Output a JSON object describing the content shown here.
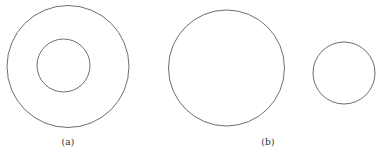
{
  "figure": {
    "background_color": "#ffffff",
    "stroke_color": "#4a4a4a",
    "stroke_width": 0.8,
    "width": 378,
    "height": 159,
    "panels": [
      {
        "id": "panel-a",
        "label": "(a)",
        "label_x": 68,
        "label_y": 142,
        "description": "annulus: one large circle with a concentric smaller circle inside",
        "shapes": [
          {
            "name": "outer-circle-a",
            "type": "circle",
            "cx": 68,
            "cy": 66.5,
            "r": 61
          },
          {
            "name": "inner-circle-a",
            "type": "circle",
            "cx": 63.5,
            "cy": 65.5,
            "r": 26.5
          }
        ]
      },
      {
        "id": "panel-b",
        "label": "(b)",
        "label_x": 268,
        "label_y": 142,
        "description": "two disjoint circles: one large and one small side by side",
        "shapes": [
          {
            "name": "large-circle-b",
            "type": "circle",
            "cx": 226.5,
            "cy": 68,
            "r": 58
          },
          {
            "name": "small-circle-b",
            "type": "circle",
            "cx": 344,
            "cy": 73,
            "r": 31
          }
        ]
      }
    ]
  }
}
